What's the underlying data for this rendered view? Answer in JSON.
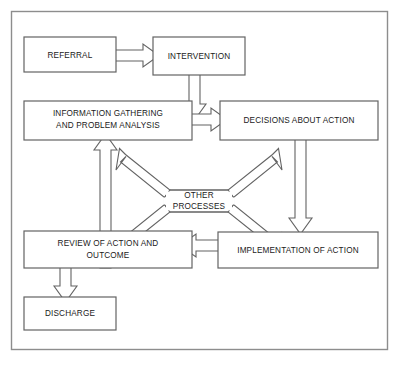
{
  "figure": {
    "frame_color": "#8d8d8d",
    "box_stroke_color": "#636363",
    "arrow_fill_color": "#ffffff",
    "text_color": "#1a1a1a",
    "background_color": "#ffffff"
  },
  "nodes": [
    {
      "id": "referral",
      "label": "REFERRAL",
      "lines": [
        "REFERRAL"
      ]
    },
    {
      "id": "intervention",
      "label": "INTERVENTION",
      "lines": [
        "INTERVENTION"
      ]
    },
    {
      "id": "information",
      "label": "INFORMATION GATHERING AND PROBLEM ANALYSIS",
      "lines": [
        "INFORMATION GATHERING",
        "AND PROBLEM ANALYSIS"
      ]
    },
    {
      "id": "decisions",
      "label": "DECISIONS ABOUT ACTION",
      "lines": [
        "DECISIONS ABOUT ACTION"
      ]
    },
    {
      "id": "other",
      "label": "OTHER PROCESSES",
      "lines": [
        "OTHER",
        "PROCESSES"
      ]
    },
    {
      "id": "review",
      "label": "REVIEW OF ACTION AND OUTCOME",
      "lines": [
        "REVIEW OF ACTION AND",
        "OUTCOME"
      ]
    },
    {
      "id": "implementation",
      "label": "IMPLEMENTATION OF ACTION",
      "lines": [
        "IMPLEMENTATION OF ACTION"
      ]
    },
    {
      "id": "discharge",
      "label": "DISCHARGE",
      "lines": [
        "DISCHARGE"
      ]
    }
  ],
  "edges": [
    {
      "from": "referral",
      "to": "intervention",
      "direction": "right"
    },
    {
      "from": "intervention",
      "to": "decisions",
      "direction": "down"
    },
    {
      "from": "information",
      "to": "decisions",
      "direction": "right"
    },
    {
      "from": "decisions",
      "to": "implementation",
      "direction": "down"
    },
    {
      "from": "implementation",
      "to": "review",
      "direction": "left"
    },
    {
      "from": "review",
      "to": "information",
      "direction": "up"
    },
    {
      "from": "review",
      "to": "discharge",
      "direction": "down"
    },
    {
      "from": "other",
      "to": "information",
      "direction": "up-left"
    },
    {
      "from": "other",
      "to": "decisions",
      "direction": "up-right"
    },
    {
      "from": "other",
      "to": "review",
      "direction": "down-left"
    },
    {
      "from": "other",
      "to": "implementation",
      "direction": "down-right"
    }
  ],
  "labels": {
    "referral": "REFERRAL",
    "intervention": "INTERVENTION",
    "information_line1": "INFORMATION GATHERING",
    "information_line2": "AND PROBLEM ANALYSIS",
    "decisions": "DECISIONS ABOUT ACTION",
    "other_line1": "OTHER",
    "other_line2": "PROCESSES",
    "review_line1": "REVIEW OF ACTION AND",
    "review_line2": "OUTCOME",
    "implementation": "IMPLEMENTATION OF ACTION",
    "discharge": "DISCHARGE"
  },
  "caption": {
    "text": ""
  }
}
